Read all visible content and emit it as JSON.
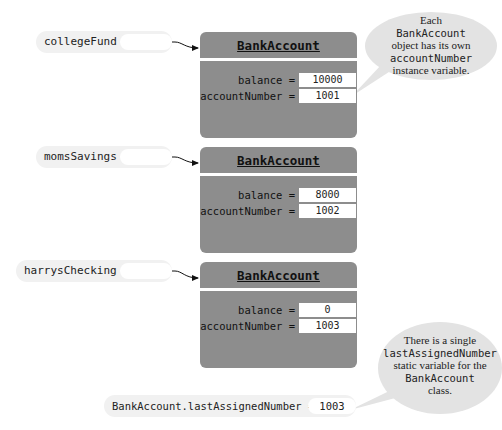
{
  "references": [
    {
      "name": "collegeFund =",
      "points_to": 0
    },
    {
      "name": "momsSavings =",
      "points_to": 1
    },
    {
      "name": "harrysChecking =",
      "points_to": 2
    }
  ],
  "objects": [
    {
      "class_name": "BankAccount",
      "fields": [
        {
          "label": "balance =",
          "value": "10000"
        },
        {
          "label": "accountNumber =",
          "value": "1001"
        }
      ]
    },
    {
      "class_name": "BankAccount",
      "fields": [
        {
          "label": "balance =",
          "value": "8000"
        },
        {
          "label": "accountNumber =",
          "value": "1002"
        }
      ]
    },
    {
      "class_name": "BankAccount",
      "fields": [
        {
          "label": "balance =",
          "value": "0"
        },
        {
          "label": "accountNumber =",
          "value": "1003"
        }
      ]
    }
  ],
  "static_variable": {
    "label": "BankAccount.lastAssignedNumber =",
    "value": "1003"
  },
  "callouts": [
    {
      "lines": [
        {
          "text": "Each",
          "style": "serif"
        },
        {
          "text": "BankAccount",
          "style": "code"
        },
        {
          "text": "object has its own",
          "style": "serif"
        },
        {
          "text": "accountNumber",
          "style": "code"
        },
        {
          "text": "instance variable.",
          "style": "serif"
        }
      ]
    },
    {
      "lines": [
        {
          "text": "There is a single",
          "style": "serif"
        },
        {
          "text": "lastAssignedNumber",
          "style": "code"
        },
        {
          "text": "static variable for the",
          "style": "serif"
        },
        {
          "text": "BankAccount",
          "style": "code"
        },
        {
          "text": "class.",
          "style": "serif"
        }
      ]
    }
  ],
  "colors": {
    "object_fill": "#8d8d8d",
    "label_pill": "#f1f1f1",
    "bubble_fill": "#e3e3e3",
    "value_box": "#ffffff"
  }
}
